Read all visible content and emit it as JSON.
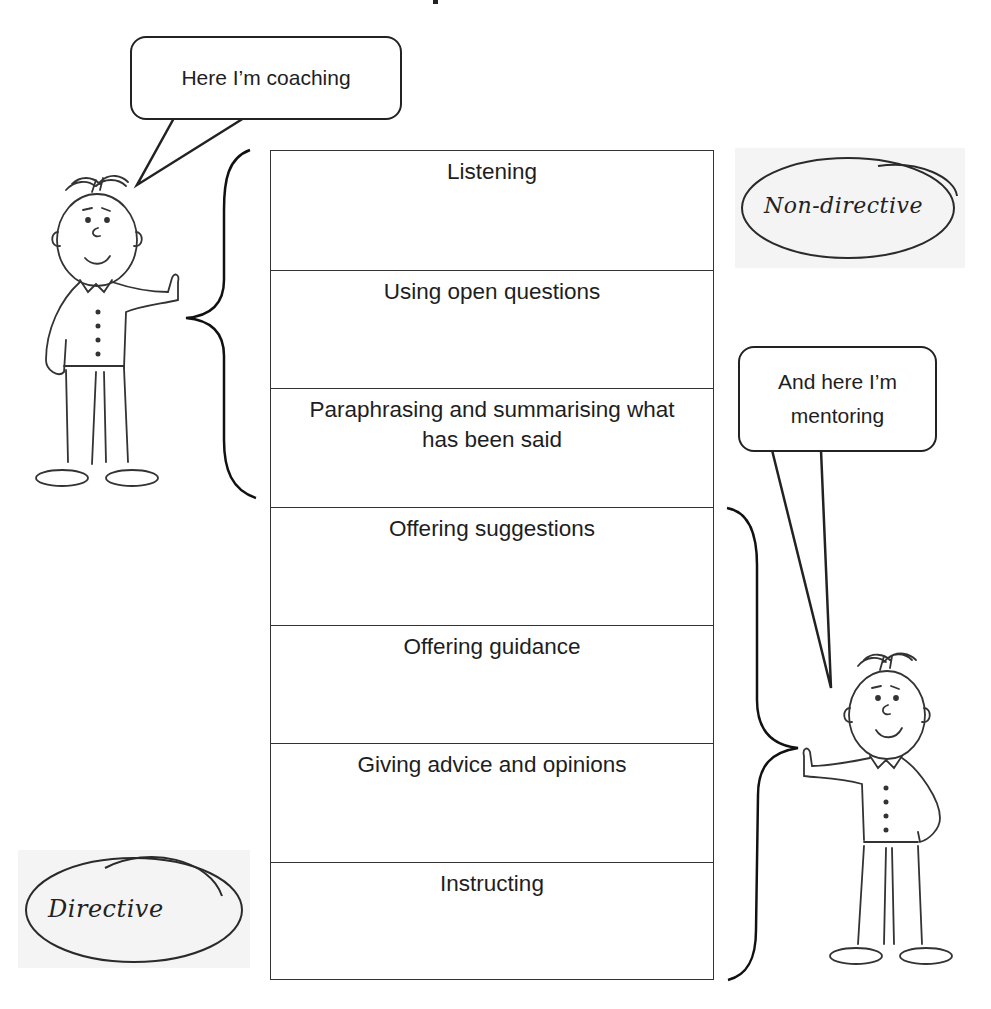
{
  "spectrum": {
    "rows": [
      {
        "label": "Listening"
      },
      {
        "label": "Using open questions"
      },
      {
        "label": "Paraphrasing and summarising what has been said"
      },
      {
        "label": "Offering suggestions"
      },
      {
        "label": "Offering guidance"
      },
      {
        "label": "Giving advice and opinions"
      },
      {
        "label": "Instructing"
      }
    ]
  },
  "bubbles": {
    "coaching": "Here I’m coaching",
    "mentoring_line1": "And here I’m",
    "mentoring_line2": "mentoring"
  },
  "labels": {
    "non_directive": "Non-directive",
    "directive": "Directive"
  },
  "colors": {
    "ink": "#222222",
    "background": "#ffffff",
    "oval_shade": "#f3f3f3"
  }
}
